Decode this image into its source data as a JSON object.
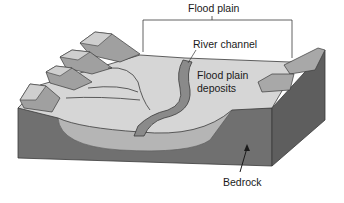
{
  "diagram": {
    "labels": {
      "flood_plain": "Flood plain",
      "river_channel": "River channel",
      "flood_plain_deposits_line1": "Flood plain",
      "flood_plain_deposits_line2": "deposits",
      "bedrock": "Bedrock"
    },
    "colors": {
      "background": "#ffffff",
      "bedrock": "#707070",
      "bedrock_side": "#5e5e5e",
      "surface": "#d6d6d6",
      "deposits": "#b5b5b5",
      "cliff": "#a0a0a0",
      "outline": "#3a3a3a",
      "text": "#1a1a1a"
    }
  }
}
